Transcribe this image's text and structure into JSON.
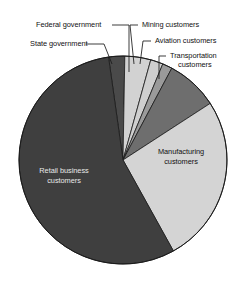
{
  "chart_data": {
    "type": "pie",
    "title": "",
    "legend_position": "callout-labels",
    "grid": false,
    "categories": [
      "State government",
      "Federal government",
      "Mining customers",
      "Aviation customers",
      "Transportation customers",
      "Manufacturing customers",
      "Retail business customers"
    ],
    "values": [
      2.5,
      4.0,
      2.0,
      1.5,
      8.0,
      26.0,
      56.0
    ],
    "unit": "percent",
    "slices": [
      {
        "label": "State government",
        "value": 2.5,
        "color": "#4a4a4a",
        "start_angle": 352.0,
        "end_angle": 361.0,
        "label_kind": "callout"
      },
      {
        "label": "Federal government",
        "value": 4.0,
        "color": "#d2d2d2",
        "start_angle": 361.0,
        "end_angle": 375.5,
        "label_kind": "callout"
      },
      {
        "label": "Mining customers",
        "value": 2.0,
        "color": "#cfcfcf",
        "start_angle": 375.5,
        "end_angle": 382.5,
        "label_kind": "callout"
      },
      {
        "label": "Aviation customers",
        "value": 1.5,
        "color": "#9a9a9a",
        "start_angle": 382.5,
        "end_angle": 388.0,
        "label_kind": "callout"
      },
      {
        "label": "Transportation customers",
        "value": 8.0,
        "color": "#6e6e6e",
        "start_angle": 388.0,
        "end_angle": 417.0,
        "label_kind": "callout"
      },
      {
        "label": "Manufacturing customers",
        "value": 26.0,
        "color": "#d4d4d4",
        "start_angle": 417.0,
        "end_angle": 511.0,
        "label_kind": "inside-light"
      },
      {
        "label": "Retail business customers",
        "value": 56.0,
        "color": "#3f3f3f",
        "start_angle": 511.0,
        "end_angle": 712.0,
        "label_kind": "inside-dark"
      }
    ]
  },
  "labels": {
    "federal_government": "Federal government",
    "state_government": "State government",
    "mining_customers": "Mining customers",
    "aviation_customers": "Aviation customers",
    "transportation_line1": "Transportation",
    "transportation_line2": "customers",
    "manufacturing_line1": "Manufacturing",
    "manufacturing_line2": "customers",
    "retail_line1": "Retail business",
    "retail_line2": "customers"
  },
  "colors": {
    "retail": "#3f3f3f",
    "manufacturing": "#d4d4d4",
    "transportation": "#6e6e6e",
    "aviation": "#9a9a9a",
    "mining": "#cfcfcf",
    "federal": "#d2d2d2",
    "state": "#4a4a4a",
    "outline": "#1a1a1a",
    "leader_line": "#1a1a1a",
    "background": "#ffffff"
  }
}
